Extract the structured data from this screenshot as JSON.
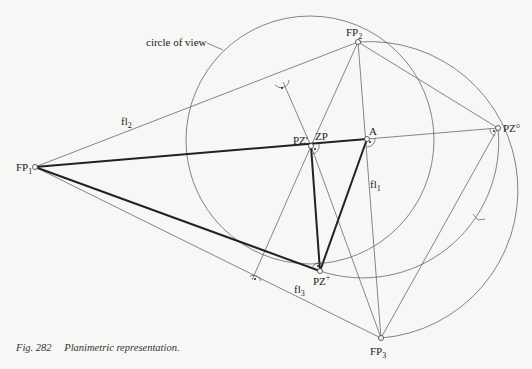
{
  "figure": {
    "caption_number": "Fig. 282",
    "caption_text": "Planimetric representation.",
    "annotation": "circle of view"
  },
  "points": {
    "FP1": {
      "label": "FP",
      "sub": "1",
      "x": 35,
      "y": 167
    },
    "FP2": {
      "label": "FP",
      "sub": "2",
      "x": 358,
      "y": 42
    },
    "FP3": {
      "label": "FP",
      "sub": "3",
      "x": 381,
      "y": 338
    },
    "PZprime": {
      "label": "PZ'",
      "x": 311,
      "y": 146
    },
    "ZP": {
      "label": "ZP",
      "x": 311,
      "y": 146
    },
    "A": {
      "label": "A",
      "x": 367,
      "y": 139
    },
    "PZo": {
      "label": "PZ°",
      "x": 498,
      "y": 128
    },
    "PZplus": {
      "label": "PZ",
      "sup": "+",
      "x": 320,
      "y": 271
    }
  },
  "line_labels": {
    "fl1": {
      "label": "fl",
      "sub": "1"
    },
    "fl2": {
      "label": "fl",
      "sub": "2"
    },
    "fl3": {
      "label": "fl",
      "sub": "3"
    }
  },
  "colors": {
    "background": "#f7f7f5",
    "line": "#555555",
    "thick_line": "#222222"
  }
}
